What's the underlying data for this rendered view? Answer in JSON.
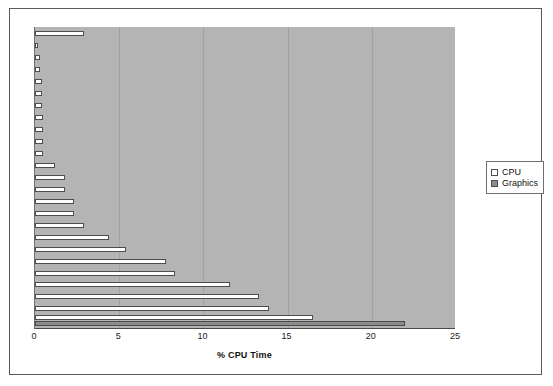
{
  "chart_data": {
    "type": "bar",
    "orientation": "horizontal",
    "title": "",
    "xlabel": "% CPU Time",
    "ylabel": "",
    "xlim": [
      0,
      25
    ],
    "xticks": [
      0,
      5,
      10,
      15,
      20,
      25
    ],
    "xtick_labels": [
      "0",
      "5",
      "10",
      "15",
      "20",
      "25"
    ],
    "grid": "vertical",
    "legend_position": "right",
    "colors": {
      "cpu": "#ffffff",
      "graphics": "#8c8c8c",
      "plot_background": "#b4b4b4",
      "page_background": "#ffffff",
      "frame": "#5a5a5a",
      "bar_outline": "#4d4d4d"
    },
    "series": [
      {
        "name": "CPU",
        "values": [
          2.9,
          0.2,
          0.3,
          0.3,
          0.4,
          0.4,
          0.4,
          0.5,
          0.5,
          0.5,
          0.5,
          1.2,
          1.8,
          1.8,
          2.3,
          2.3,
          2.9,
          4.4,
          5.4,
          7.8,
          8.3,
          11.6,
          13.3,
          13.9,
          16.5
        ]
      },
      {
        "name": "Graphics",
        "values": [
          0,
          0,
          0,
          0,
          0,
          0,
          0,
          0,
          0,
          0,
          0,
          0,
          0,
          0,
          0,
          0,
          0,
          0,
          0,
          0,
          0,
          0,
          0,
          0,
          22.0
        ]
      }
    ]
  },
  "legend": {
    "items": [
      {
        "label": "CPU",
        "swatch": "cpu"
      },
      {
        "label": "Graphics",
        "swatch": "graphics"
      }
    ]
  },
  "axis": {
    "x_title": "% CPU Time"
  }
}
